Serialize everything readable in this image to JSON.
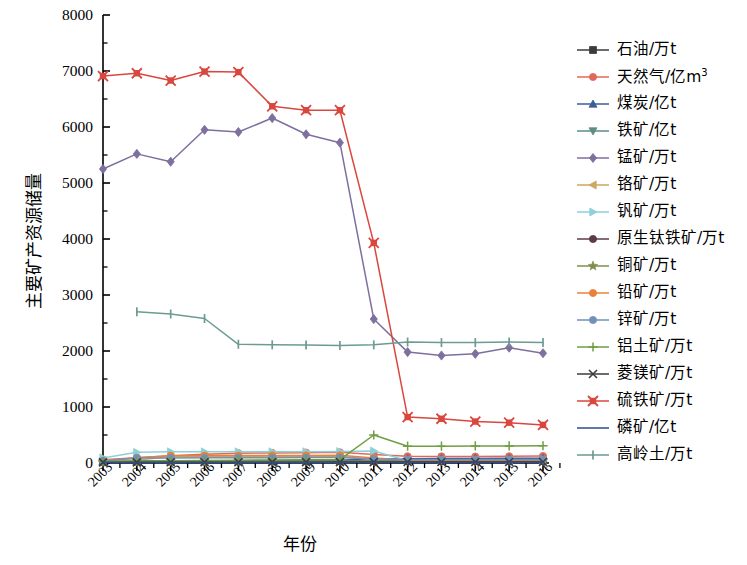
{
  "chart_data": {
    "type": "line",
    "title": "",
    "xlabel": "年份",
    "ylabel": "主要矿产资源储量",
    "x": [
      "2003",
      "2004",
      "2005",
      "2006",
      "2007",
      "2008",
      "2009",
      "2010",
      "2011",
      "2012",
      "2013",
      "2014",
      "2015",
      "2016"
    ],
    "ylim": [
      0,
      8000
    ],
    "yticks": [
      0,
      1000,
      2000,
      3000,
      4000,
      5000,
      6000,
      7000,
      8000
    ],
    "ytick_labels": [
      "0",
      "1000",
      "2000",
      "3000",
      "4000",
      "5000",
      "6000",
      "7000",
      "8000"
    ],
    "minor_yticks": true,
    "grid": false,
    "legend_position": "right",
    "series": [
      {
        "name": "石油/万t",
        "color": "#3b3b3b",
        "marker": "square",
        "values": [
          25,
          30,
          32,
          34,
          36,
          38,
          38,
          40,
          42,
          44,
          44,
          45,
          46,
          47
        ]
      },
      {
        "name": "天然气/亿m³",
        "color": "#e0685a",
        "marker": "circle",
        "unit_sup": "3",
        "values": [
          60,
          95,
          130,
          155,
          175,
          180,
          185,
          190,
          150,
          120,
          118,
          115,
          120,
          125
        ]
      },
      {
        "name": "煤炭/亿t",
        "color": "#3c5d96",
        "marker": "triangle-up",
        "values": [
          28,
          32,
          35,
          38,
          40,
          42,
          45,
          48,
          75,
          78,
          80,
          82,
          85,
          86
        ]
      },
      {
        "name": "铁矿/亿t",
        "color": "#5d8d85",
        "marker": "triangle-down",
        "values": [
          15,
          18,
          18,
          19,
          20,
          20,
          21,
          22,
          24,
          25,
          25,
          26,
          27,
          27
        ]
      },
      {
        "name": "锰矿/万t",
        "color": "#7e6f9e",
        "marker": "diamond",
        "values": [
          5250,
          5520,
          5380,
          5950,
          5910,
          6160,
          5870,
          5720,
          2570,
          1980,
          1920,
          1950,
          2060,
          1960
        ]
      },
      {
        "name": "铬矿/万t",
        "color": "#c9a95e",
        "marker": "triangle-left",
        "values": [
          45,
          55,
          110,
          112,
          115,
          118,
          118,
          120,
          60,
          50,
          48,
          48,
          47,
          47
        ]
      },
      {
        "name": "钒矿/万t",
        "color": "#8dd0d8",
        "marker": "triangle-right",
        "values": [
          90,
          190,
          200,
          200,
          200,
          200,
          200,
          205,
          215,
          40,
          38,
          38,
          38,
          38
        ]
      },
      {
        "name": "原生钛铁矿/万t",
        "color": "#5b3a4a",
        "marker": "circle",
        "values": [
          18,
          20,
          22,
          24,
          25,
          26,
          26,
          28,
          30,
          30,
          31,
          31,
          32,
          32
        ]
      },
      {
        "name": "铜矿/万t",
        "color": "#7c8f4a",
        "marker": "star",
        "values": [
          20,
          25,
          26,
          28,
          30,
          32,
          33,
          35,
          38,
          40,
          40,
          41,
          42,
          42
        ]
      },
      {
        "name": "铅矿/万t",
        "color": "#e8823a",
        "marker": "circle",
        "values": [
          40,
          92,
          130,
          132,
          134,
          136,
          136,
          138,
          90,
          55,
          54,
          53,
          53,
          53
        ]
      },
      {
        "name": "锌矿/万t",
        "color": "#7290b8",
        "marker": "circle",
        "values": [
          35,
          88,
          90,
          92,
          94,
          95,
          96,
          98,
          70,
          62,
          62,
          62,
          63,
          63
        ]
      },
      {
        "name": "铝土矿/万t",
        "color": "#6f9e43",
        "marker": "plus",
        "values": [
          25,
          35,
          40,
          45,
          50,
          55,
          58,
          62,
          500,
          300,
          300,
          305,
          305,
          308
        ]
      },
      {
        "name": "菱镁矿/万t",
        "color": "#3b3b3b",
        "marker": "x",
        "values": [
          10,
          12,
          13,
          14,
          14,
          15,
          15,
          16,
          16,
          17,
          17,
          18,
          18,
          18
        ]
      },
      {
        "name": "硫铁矿/万t",
        "color": "#d9473e",
        "marker": "x-square",
        "values": [
          6910,
          6960,
          6830,
          6990,
          6980,
          6370,
          6300,
          6300,
          3930,
          820,
          790,
          740,
          720,
          680
        ]
      },
      {
        "name": "磷矿/亿t",
        "color": "#2f4b8f",
        "marker": "none",
        "values": [
          8,
          9,
          9,
          10,
          10,
          11,
          11,
          12,
          12,
          13,
          13,
          14,
          14,
          14
        ]
      },
      {
        "name": "高岭土/万t",
        "color": "#6b9b92",
        "marker": "dash",
        "values": [
          null,
          2700,
          2660,
          2580,
          2120,
          2110,
          2105,
          2100,
          2110,
          2160,
          2150,
          2150,
          2160,
          2150
        ]
      }
    ]
  },
  "axis": {
    "x_title": "年份",
    "y_title": "主要矿产资源储量"
  }
}
